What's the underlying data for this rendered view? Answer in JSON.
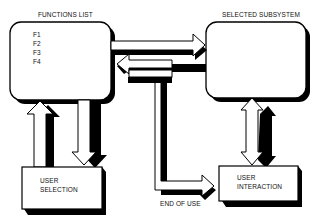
{
  "diagram": {
    "nodes": {
      "functions_list": {
        "title": "FUNCTIONS LIST",
        "items": [
          "F1",
          "F2",
          "F3",
          "F4"
        ]
      },
      "selected_subsystem": {
        "title": "SELECTED SUBSYSTEM"
      },
      "user_selection": {
        "line1": "USER",
        "line2": "SELECTION"
      },
      "user_interaction": {
        "line1": "USER",
        "line2": "INTERACTION"
      }
    },
    "edges": [
      {
        "from": "functions_list",
        "to": "selected_subsystem",
        "direction": "right"
      },
      {
        "from": "selected_subsystem",
        "to": "functions_list",
        "direction": "left"
      },
      {
        "from": "user_selection",
        "to": "functions_list",
        "direction": "up"
      },
      {
        "from": "functions_list",
        "to": "user_selection",
        "direction": "down"
      },
      {
        "from": "selected_subsystem",
        "to": "user_interaction",
        "direction": "bidirectional"
      },
      {
        "from": "functions_list",
        "to": "user_interaction",
        "label": "END OF USE",
        "direction": "down-right"
      }
    ],
    "labels": {
      "end_of_use": "END OF USE"
    },
    "colors": {
      "stroke": "#000000",
      "fill": "#ffffff",
      "shadow": "#000000"
    }
  }
}
